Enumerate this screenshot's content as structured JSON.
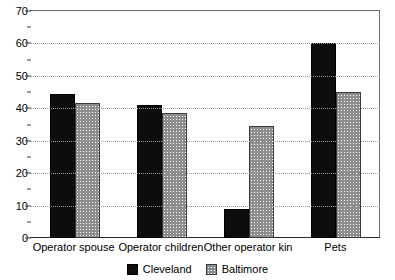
{
  "chart_data": {
    "type": "bar",
    "title": "",
    "subtitle": "",
    "xlabel": "",
    "ylabel": "",
    "ylim": [
      0,
      70
    ],
    "y_ticks": [
      0,
      10,
      20,
      30,
      40,
      50,
      60,
      70
    ],
    "y_tick_labels": [
      "0",
      "10",
      "20",
      "30",
      "40",
      "50",
      "60",
      "70"
    ],
    "y_minor_ticks": [
      5,
      15,
      25,
      35,
      45,
      55,
      65
    ],
    "grid": "horizontal-dotted",
    "grid_values": [
      10,
      20,
      30,
      40,
      50,
      60
    ],
    "legend_position": "bottom-center",
    "categories": [
      "Operator spouse",
      "Operator children",
      "Other operator kin",
      "Pets"
    ],
    "series": [
      {
        "name": "Cleveland",
        "color": "#0d0d0d",
        "pattern": "solid-black",
        "values": [
          44.5,
          41,
          9,
          60
        ]
      },
      {
        "name": "Baltimore",
        "color": "#8d8d8d",
        "pattern": "checkered-gray",
        "values": [
          41.5,
          38.5,
          34.5,
          45
        ]
      }
    ]
  },
  "legend": {
    "items": [
      {
        "label": "Cleveland",
        "swatch": "solid-black-swatch"
      },
      {
        "label": "Baltimore",
        "swatch": "checkered-gray-swatch"
      }
    ]
  }
}
